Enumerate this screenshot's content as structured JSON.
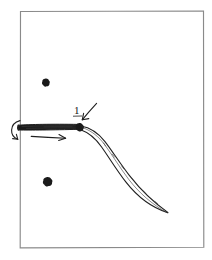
{
  "figure": {
    "title": "",
    "background_color": "#ffffff",
    "ink_color": "#1a1a1a",
    "frame_color": "#8a8a8a",
    "style": "hand-drawn pen sketch",
    "frame": {
      "name": "panel-border",
      "x": 20,
      "y": 11,
      "width": 184,
      "height": 237
    },
    "labels": [
      {
        "id": "label-1",
        "text": "1",
        "underlined": true,
        "x": 76,
        "y": 114
      }
    ],
    "annotations": {
      "callout_arrow": {
        "name": "callout-arrow",
        "description": "short arrow pointing down-left from label 1 to the joint node",
        "from_x": 97,
        "from_y": 103,
        "to_x": 82,
        "to_y": 120
      },
      "rotation_arrow": {
        "name": "rotation-arrow",
        "description": "curved arrow curling counterclockwise at the left base of the bar",
        "x": 14,
        "y": 132
      },
      "translation_arrow": {
        "name": "translation-arrow",
        "description": "straight arrow pointing right beneath the bar",
        "from_x": 31,
        "from_y": 137,
        "to_x": 65,
        "to_y": 138
      }
    },
    "shapes": {
      "bar": {
        "name": "horizontal-bar",
        "description": "thin elongated tapered bar spanning from the left frame edge to the joint",
        "x1": 18,
        "y1": 127,
        "x2": 79,
        "y2": 126,
        "thickness": 5
      },
      "joint": {
        "name": "joint-node",
        "description": "solid black node where the bar meets the curved tail",
        "cx": 80,
        "cy": 127,
        "r": 3.2
      },
      "tail": {
        "name": "curved-tail",
        "description": "double-line tapering curve sweeping down-right from the joint to a fine point",
        "start_x": 81,
        "start_y": 128,
        "end_x": 168,
        "end_y": 213
      }
    },
    "dots": [
      {
        "name": "ink-dot-upper",
        "cx": 46,
        "cy": 82,
        "r": 3.1
      },
      {
        "name": "ink-dot-lower",
        "cx": 48,
        "cy": 181,
        "r": 3.6
      }
    ]
  }
}
